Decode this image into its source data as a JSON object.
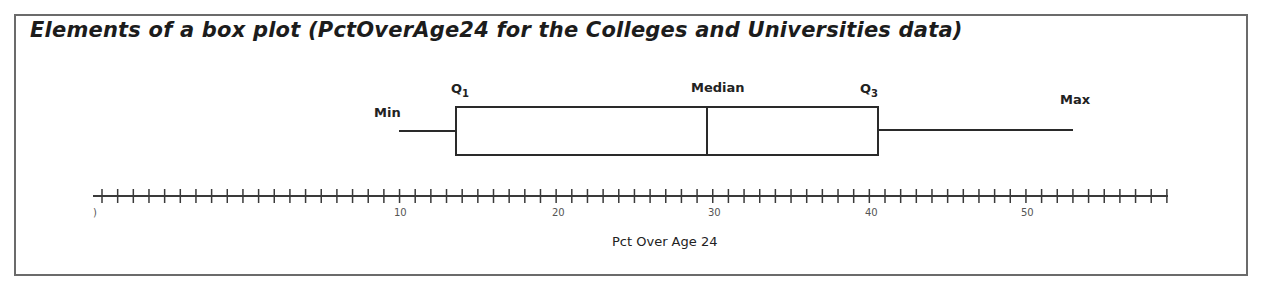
{
  "title": "Elements of a box plot (PctOverAge24 for the Colleges and Universities data)",
  "labels": {
    "min": "Min",
    "q1": "Q",
    "q1_sub": "1",
    "median": "Median",
    "q3": "Q",
    "q3_sub": "3",
    "max": "Max"
  },
  "axis": {
    "xlabel": "Pct Over Age 24",
    "tick_labels": [
      ")",
      "10",
      "20",
      "30",
      "40",
      "50"
    ]
  },
  "colors": {
    "line": "#2a2a2a",
    "frame": "#6b6b6b",
    "text": "#1c1c1c"
  },
  "chart_data": {
    "type": "box",
    "title": "Elements of a box plot (PctOverAge24 for the Colleges and Universities data)",
    "xlabel": "Pct Over Age 24",
    "ylabel": "",
    "orientation": "horizontal",
    "stats": {
      "min": 10,
      "q1": 13.6,
      "median": 29.6,
      "q3": 40.5,
      "max": 53
    },
    "annotations": [
      "Min",
      "Q1",
      "Median",
      "Q3",
      "Max"
    ],
    "xticks_major": [
      0,
      10,
      20,
      30,
      40,
      50
    ],
    "minor_tick_step": 1,
    "xlim": [
      0,
      58
    ],
    "grid": false,
    "legend": null
  }
}
